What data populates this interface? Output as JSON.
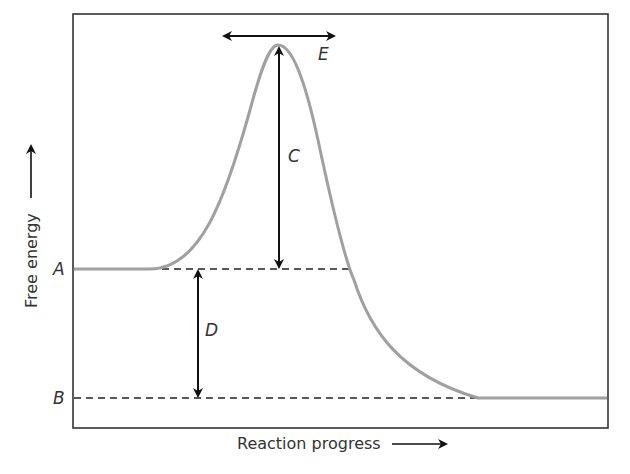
{
  "diagram": {
    "type": "energy-profile",
    "y_axis_label": "Free energy",
    "x_axis_label": "Reaction progress",
    "levels": {
      "start": {
        "label": "A"
      },
      "end": {
        "label": "B"
      }
    },
    "annotations": {
      "activation_energy": {
        "label": "C"
      },
      "energy_difference": {
        "label": "D"
      },
      "transition_state_width": {
        "label": "E"
      }
    },
    "colors": {
      "curve": "#a0a0a0",
      "frame": "#333333",
      "arrows": "#111111",
      "dashed": "#222222"
    }
  }
}
